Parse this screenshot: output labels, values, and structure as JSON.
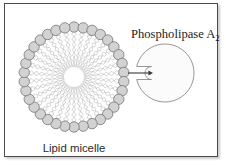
{
  "figure": {
    "width": 226,
    "height": 166,
    "background": "#ffffff",
    "frame": {
      "border_color": "#4a4a4a",
      "shadow_color": "#9a9a9a"
    }
  },
  "labels": {
    "enzyme_name_main": "Phospholipase A",
    "enzyme_name_subscript": "2",
    "enzyme_name_full": "Phospholipase A2",
    "structure_caption": "Lipid micelle"
  },
  "micelle": {
    "name": "lipid-micelle",
    "center_x": 74,
    "center_y": 77,
    "head_ring_radius": 50,
    "head_count": 34,
    "head_radius": 5.2,
    "head_fill": "#d2d2d2",
    "head_stroke": "#6e6e6e",
    "tail_color": "#b4b4b4",
    "tail_inner_radius": 10,
    "tails_per_head": 2,
    "core_fill": "#ffffff",
    "core_radius": 9
  },
  "enzyme": {
    "name": "phospholipase-a2",
    "center_x": 165,
    "center_y": 73,
    "radius": 29,
    "fill": "#fbfbfb",
    "stroke": "#8a8a8a",
    "active_site": {
      "name": "active-site-cleft",
      "depth": 22,
      "half_height": 6.5,
      "opening_x": 136
    }
  },
  "arrow": {
    "name": "substrate-entry-arrow",
    "color": "#3a3a3a",
    "start_x": 128,
    "end_x": 153,
    "y": 73
  },
  "colors": {
    "ink": "#1c1c1c",
    "head_gray": "#d2d2d2",
    "tail_gray": "#b4b4b4",
    "outline_gray": "#6e6e6e"
  }
}
